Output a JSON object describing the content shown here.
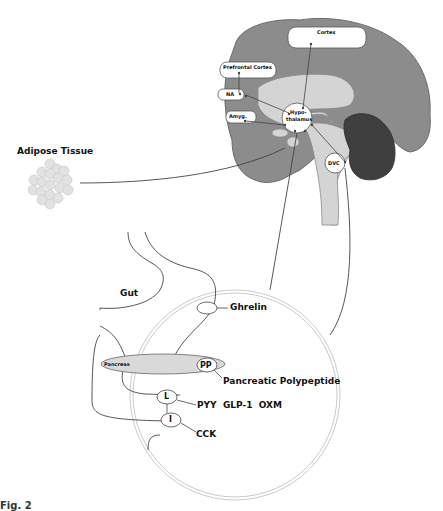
{
  "diagram": {
    "colors": {
      "cortex_gray": "#8c8c8c",
      "inner_light": "#d4d4d4",
      "cerebellum_dark": "#3f3f3f",
      "pancreas_fill": "#d9d9d9",
      "line": "#444444",
      "circle_outline": "#bdbdbd"
    },
    "brain": {
      "cortex": "Cortex",
      "prefrontal_cortex": "Prefrontal Cortex",
      "na": "NA",
      "amygdala": "Amyg.",
      "hypothalamus": "Hypo-\nthalamus",
      "hypothalamus_line1": "Hypo-",
      "hypothalamus_line2": "thalamus",
      "dvc": "DVC"
    },
    "adipose": {
      "label": "Adipose Tissue"
    },
    "gut": {
      "label": "Gut",
      "ghrelin": "Ghrelin",
      "pancreas": "Pancreas",
      "pp": "PP",
      "pancreatic_polypeptide": "Pancreatic Polypeptide",
      "l_cell": "L",
      "l_hormones": "PYY  GLP-1  OXM",
      "i_cell": "I",
      "i_hormone": "CCK"
    },
    "caption": "Fig. 2"
  }
}
